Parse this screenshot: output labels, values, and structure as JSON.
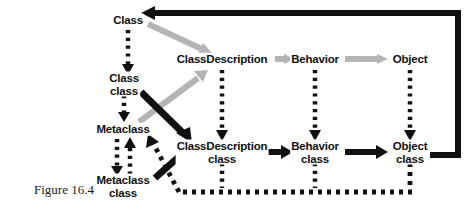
{
  "figure": {
    "caption": "Figure 16.4",
    "caption_x": 64,
    "caption_y": 190,
    "background_color": "#ffffff",
    "ink_color": "#111111",
    "gray_color": "#b4b4b4"
  },
  "nodes": [
    {
      "id": "class",
      "label": "Class",
      "x": 128,
      "y": 20
    },
    {
      "id": "class-class",
      "label": "Class\nclass",
      "x": 124,
      "y": 84
    },
    {
      "id": "metaclass",
      "label": "Metaclass",
      "x": 123,
      "y": 129
    },
    {
      "id": "metaclass-class",
      "label": "Metaclass\nclass",
      "x": 123,
      "y": 186
    },
    {
      "id": "classdescription",
      "label": "ClassDescription",
      "x": 222,
      "y": 59
    },
    {
      "id": "behavior",
      "label": "Behavior",
      "x": 315,
      "y": 59
    },
    {
      "id": "object",
      "label": "Object",
      "x": 410,
      "y": 59
    },
    {
      "id": "classdescription-class",
      "label": "ClassDescription\nclass",
      "x": 222,
      "y": 152
    },
    {
      "id": "behavior-class",
      "label": "Behavior\nclass",
      "x": 315,
      "y": 152
    },
    {
      "id": "object-class",
      "label": "Object\nclass",
      "x": 410,
      "y": 152
    }
  ],
  "edges": [
    {
      "id": "class-to-class-class",
      "style": "dotted",
      "color": "#111111",
      "direction": "down",
      "from": "class",
      "to": "class-class"
    },
    {
      "id": "class-class-to-metaclass",
      "style": "dotted",
      "color": "#111111",
      "direction": "down",
      "from": "class-class",
      "to": "metaclass"
    },
    {
      "id": "metaclass-to-metaclass-class",
      "style": "dotted",
      "color": "#111111",
      "direction": "down",
      "from": "metaclass",
      "to": "metaclass-class"
    },
    {
      "id": "metaclass-class-to-metaclass",
      "style": "dotted",
      "color": "#111111",
      "direction": "up",
      "from": "metaclass-class",
      "to": "metaclass"
    },
    {
      "id": "classdescription-to-cd-class",
      "style": "dotted",
      "color": "#111111",
      "direction": "down",
      "from": "classdescription",
      "to": "classdescription-class"
    },
    {
      "id": "behavior-to-behavior-class",
      "style": "dotted",
      "color": "#111111",
      "direction": "down",
      "from": "behavior",
      "to": "behavior-class"
    },
    {
      "id": "object-to-object-class",
      "style": "dotted",
      "color": "#111111",
      "direction": "down",
      "from": "object",
      "to": "object-class"
    },
    {
      "id": "class-to-classdescription",
      "style": "solid",
      "color": "#b4b4b4",
      "direction": "down-right",
      "from": "class",
      "to": "classdescription"
    },
    {
      "id": "metaclass-to-classdescription",
      "style": "solid",
      "color": "#b4b4b4",
      "direction": "up-right",
      "from": "metaclass",
      "to": "classdescription"
    },
    {
      "id": "classdescription-to-behavior",
      "style": "solid",
      "color": "#b4b4b4",
      "direction": "right",
      "from": "classdescription",
      "to": "behavior"
    },
    {
      "id": "behavior-to-object",
      "style": "solid",
      "color": "#b4b4b4",
      "direction": "right",
      "from": "behavior",
      "to": "object"
    },
    {
      "id": "class-class-to-cd-class",
      "style": "solid",
      "color": "#111111",
      "direction": "down-right",
      "from": "class-class",
      "to": "classdescription-class"
    },
    {
      "id": "cd-class-to-behavior-class",
      "style": "solid",
      "color": "#111111",
      "direction": "right",
      "from": "classdescription-class",
      "to": "behavior-class"
    },
    {
      "id": "behavior-class-to-object-class",
      "style": "solid",
      "color": "#111111",
      "direction": "right",
      "from": "behavior-class",
      "to": "object-class"
    },
    {
      "id": "metaclass-class-to-cd-class",
      "style": "solid",
      "color": "#111111",
      "direction": "up-right",
      "from": "metaclass-class",
      "to": "classdescription-class"
    },
    {
      "id": "object-class-to-class",
      "style": "solid",
      "color": "#111111",
      "direction": "around-top",
      "from": "object-class",
      "to": "class"
    },
    {
      "id": "object-class-to-metaclass",
      "style": "dotted",
      "color": "#111111",
      "direction": "around-bottom-left",
      "from": "object-class",
      "to": "metaclass"
    }
  ]
}
